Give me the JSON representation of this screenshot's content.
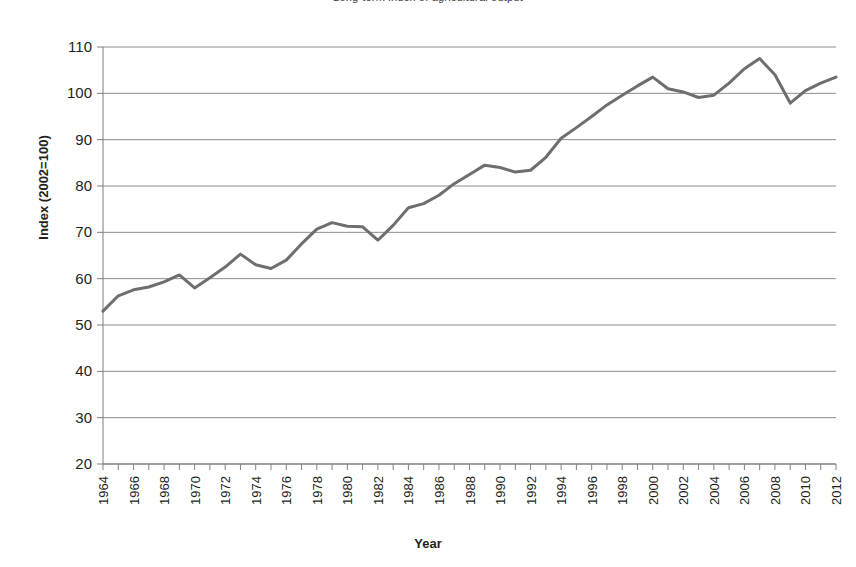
{
  "chart_data": {
    "type": "line",
    "title": "Long-term index of agricultural output",
    "xlabel": "Year",
    "ylabel": "Index (2002=100)",
    "ylim": [
      20,
      110
    ],
    "ytick_step": 10,
    "yticks": [
      20,
      30,
      40,
      50,
      60,
      70,
      80,
      90,
      100,
      110
    ],
    "xlim": [
      1964,
      2012
    ],
    "xtick_labels": [
      "1964",
      "1966",
      "1968",
      "1970",
      "1972",
      "1974",
      "1976",
      "1978",
      "1980",
      "1982",
      "1984",
      "1986",
      "1988",
      "1990",
      "1992",
      "1994",
      "1996",
      "1998",
      "2000",
      "2002",
      "2004",
      "2006",
      "2008",
      "2010",
      "2012"
    ],
    "xtick_label_rotation": -90,
    "grid": "horizontal",
    "legend": "none",
    "line_color": "#6e6e6e",
    "line_width": 3,
    "series": [
      {
        "name": "Index (2002=100)",
        "x": [
          1964,
          1965,
          1966,
          1967,
          1968,
          1969,
          1970,
          1971,
          1972,
          1973,
          1974,
          1975,
          1976,
          1977,
          1978,
          1979,
          1980,
          1981,
          1982,
          1983,
          1984,
          1985,
          1986,
          1987,
          1988,
          1989,
          1990,
          1991,
          1992,
          1993,
          1994,
          1995,
          1996,
          1997,
          1998,
          1999,
          2000,
          2001,
          2002,
          2003,
          2004,
          2005,
          2006,
          2007,
          2008,
          2009,
          2010,
          2011,
          2012
        ],
        "values": [
          53.0,
          56.3,
          57.6,
          58.2,
          59.3,
          60.8,
          58.0,
          60.2,
          62.5,
          65.3,
          63.0,
          62.2,
          64.0,
          67.5,
          70.7,
          72.1,
          71.3,
          71.2,
          68.3,
          71.5,
          75.3,
          76.2,
          78.0,
          80.5,
          82.5,
          84.5,
          84.0,
          83.0,
          83.4,
          86.2,
          90.3,
          92.6,
          95.0,
          97.5,
          99.6,
          101.6,
          103.5,
          101.0,
          100.3,
          99.1,
          99.6,
          102.2,
          105.3,
          107.5,
          104.0,
          97.9,
          100.6,
          102.2,
          103.5
        ]
      }
    ]
  },
  "axes": {
    "y_title": "Index (2002=100)",
    "x_title": "Year"
  }
}
